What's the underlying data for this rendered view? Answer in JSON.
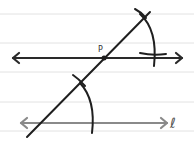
{
  "diagram": {
    "type": "geometry-construction",
    "labels": {
      "point": "P",
      "line": "ℓ"
    },
    "colors": {
      "background": "#ffffff",
      "ruled_lines": "#e2e2e2",
      "construction": "#1f1f1f",
      "given_line": "#8a8a8a"
    },
    "ruled_lines_y": [
      14,
      43,
      72,
      102,
      131
    ],
    "elements": [
      {
        "id": "parallel-line-through-P",
        "from": [
          12,
          58
        ],
        "to": [
          183,
          58
        ],
        "arrows": "both"
      },
      {
        "id": "given-line-l",
        "from": [
          20,
          123
        ],
        "to": [
          168,
          123
        ],
        "arrows": "both"
      },
      {
        "id": "transversal",
        "from": [
          27,
          137
        ],
        "to": [
          150,
          12
        ]
      },
      {
        "id": "point-P",
        "at": [
          104,
          58
        ]
      }
    ]
  }
}
